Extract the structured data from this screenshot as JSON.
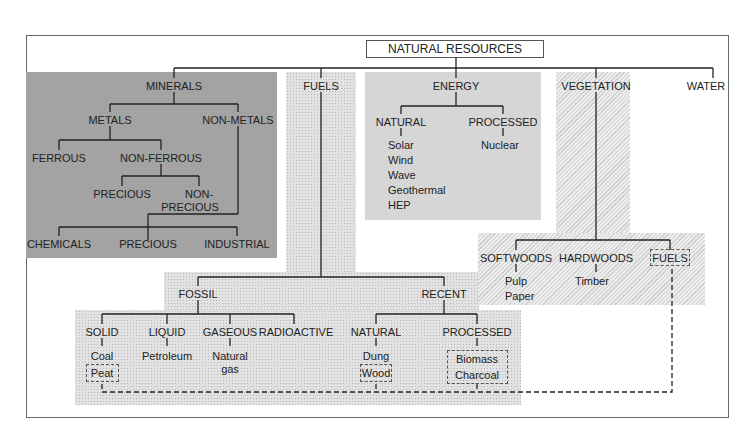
{
  "diagram": {
    "root": "NATURAL RESOURCES",
    "categories": {
      "minerals": {
        "label": "MINERALS",
        "metals": "METALS",
        "non_metals": "NON-METALS",
        "ferrous": "FERROUS",
        "non_ferrous": "NON-FERROUS",
        "precious": "PRECIOUS",
        "non_precious_1": "NON-",
        "non_precious_2": "PRECIOUS",
        "chemicals": "CHEMICALS",
        "nm_precious": "PRECIOUS",
        "industrial": "INDUSTRIAL"
      },
      "fuels": {
        "label": "FUELS",
        "fossil": "FOSSIL",
        "recent": "RECENT",
        "solid": "SOLID",
        "liquid": "LIQUID",
        "gaseous": "GASEOUS",
        "radioactive": "RADIOACTIVE",
        "coal": "Coal",
        "peat": "Peat",
        "petroleum": "Petroleum",
        "natural_gas_1": "Natural",
        "natural_gas_2": "gas",
        "natural": "NATURAL",
        "processed": "PROCESSED",
        "dung": "Dung",
        "wood": "Wood",
        "biomass": "Biomass",
        "charcoal": "Charcoal"
      },
      "energy": {
        "label": "ENERGY",
        "natural": "NATURAL",
        "processed": "PROCESSED",
        "natural_items": [
          "Solar",
          "Wind",
          "Wave",
          "Geothermal",
          "HEP"
        ],
        "processed_items": [
          "Nuclear"
        ]
      },
      "vegetation": {
        "label": "VEGETATION",
        "softwoods": "SOFTWOODS",
        "hardwoods": "HARDWOODS",
        "fuels": "FUELS",
        "softwood_items": [
          "Pulp",
          "Paper"
        ],
        "hardwood_items": [
          "Timber"
        ]
      },
      "water": {
        "label": "WATER"
      }
    }
  }
}
